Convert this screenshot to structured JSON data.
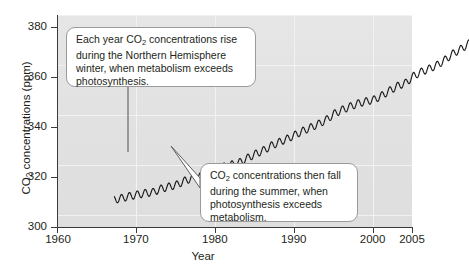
{
  "figure": {
    "name": "atmospheric-co2-keeling-curve",
    "background_color": "#ffffff",
    "plot_background_color": "#e3e3e3"
  },
  "chart_data": {
    "type": "line",
    "title": "",
    "subtitle": "",
    "xlabel": "Year",
    "ylabel": "CO2 concentrations (ppm)",
    "ylabel_rich": {
      "prefix": "CO",
      "subscript": "2",
      "suffix": " concentrations (ppm)"
    },
    "xlim": [
      1960,
      2005
    ],
    "ylim": [
      300,
      385
    ],
    "xticks": [
      1960,
      1970,
      1980,
      1990,
      2000,
      2005
    ],
    "xtick_labels": [
      "1960",
      "1970",
      "1980",
      "1990",
      "2000",
      "2005"
    ],
    "yticks": [
      300,
      320,
      340,
      360,
      380
    ],
    "ytick_labels": [
      "300",
      "320",
      "340",
      "360",
      "380"
    ],
    "grid": true,
    "grid_color": "#f2f2f2",
    "legend": "none",
    "line_color": "#1a1a1a",
    "line_width": 1.2,
    "series": [
      {
        "name": "Atmospheric CO2 (Mauna Loa)",
        "description": "Annual mean CO2 concentration with seasonal sawtooth oscillation",
        "x": [
          1960,
          1961,
          1962,
          1963,
          1964,
          1965,
          1966,
          1967,
          1968,
          1969,
          1970,
          1971,
          1972,
          1973,
          1974,
          1975,
          1976,
          1977,
          1978,
          1979,
          1980,
          1981,
          1982,
          1983,
          1984,
          1985,
          1986,
          1987,
          1988,
          1989,
          1990,
          1991,
          1992,
          1993,
          1994,
          1995,
          1996,
          1997,
          1998,
          1999,
          2000,
          2001,
          2002,
          2003,
          2004,
          2005
        ],
        "values": [
          316.9,
          317.6,
          318.4,
          319.0,
          319.6,
          320.0,
          321.4,
          322.2,
          323.0,
          324.6,
          325.7,
          326.3,
          327.5,
          329.7,
          330.2,
          331.1,
          332.0,
          333.8,
          335.4,
          336.8,
          338.7,
          340.1,
          341.4,
          343.0,
          344.6,
          346.0,
          347.4,
          349.2,
          351.6,
          353.1,
          354.4,
          355.6,
          356.4,
          357.1,
          358.8,
          360.8,
          362.6,
          363.8,
          366.6,
          368.3,
          369.5,
          371.0,
          373.1,
          375.6,
          377.4,
          379.6
        ],
        "seasonal_amplitude_ppm": 3.0,
        "seasonal_cycles_per_year": 1
      }
    ],
    "annotations": [
      {
        "id": "annotation-rise",
        "text": "Each year CO2 concentrations rise during the Northern Hemisphere winter, when metabolism exceeds photosynthesis.",
        "lines": [
          "Each year CO2 concentrations rise",
          "during the Northern Hemisphere",
          "winter, when metabolism exceeds",
          "photosynthesis."
        ],
        "rich": {
          "before": "Each year CO",
          "subscript": "2",
          "after": " concentrations rise during the Northern Hemisphere winter, when metabolism exceeds photosynthesis."
        },
        "points_to_year": 1972,
        "points_to_value": 327
      },
      {
        "id": "annotation-fall",
        "text": "CO2 concentrations then fall during the summer, when photosynthesis exceeds metabolism.",
        "lines": [
          "CO2 concentrations then",
          "fall during the summer,",
          "when photosynthesis",
          "exceeds metabolism."
        ],
        "rich": {
          "before": "CO",
          "subscript": "2",
          "after": " concentrations then fall during the summer, when photosynthesis exceeds metabolism."
        },
        "points_to_year": 1978,
        "points_to_value": 333
      }
    ]
  }
}
